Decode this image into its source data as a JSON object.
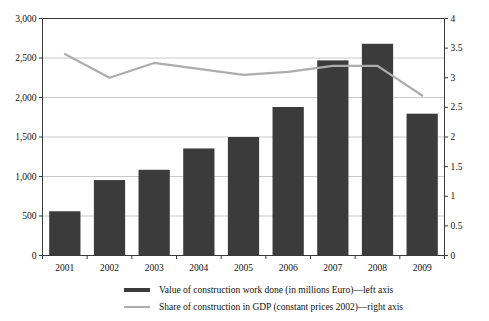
{
  "chart_data": {
    "type": "bar",
    "title": "",
    "subtitle": "",
    "xlabel": "",
    "ylabel": "",
    "grid": true,
    "legend_position": "bottom",
    "categories": [
      "2001",
      "2002",
      "2003",
      "2004",
      "2005",
      "2006",
      "2007",
      "2008",
      "2009"
    ],
    "left_axis": {
      "label": "Value of construction work done (in millions Euro)",
      "min": 0,
      "max": 3000,
      "tick_step": 500,
      "ticks": [
        "0",
        "500",
        "1,000",
        "1,500",
        "2,000",
        "2,500",
        "3,000"
      ],
      "tick_values": [
        0,
        500,
        1000,
        1500,
        2000,
        2500,
        3000
      ]
    },
    "right_axis": {
      "label": "Share of construction in GDP (constant prices 2002)",
      "min": 0,
      "max": 4,
      "tick_step": 0.5,
      "ticks": [
        "0",
        "0.5",
        "1",
        "1.5",
        "2",
        "2.5",
        "3",
        "3.5",
        "4"
      ],
      "tick_values": [
        0,
        0.5,
        1,
        1.5,
        2,
        2.5,
        3,
        3.5,
        4
      ]
    },
    "series": [
      {
        "name": "Value of construction work done (in millions Euro)—left axis",
        "type": "bar",
        "axis": "left",
        "color": "#3b3b3b",
        "values": [
          560,
          955,
          1085,
          1355,
          1500,
          1880,
          2470,
          2680,
          1795
        ]
      },
      {
        "name": "Share of construction in GDP (constant prices 2002)—right axis",
        "type": "line",
        "axis": "right",
        "color": "#adadad",
        "values": [
          3.4,
          3.0,
          3.25,
          3.15,
          3.05,
          3.1,
          3.2,
          3.2,
          2.7
        ]
      }
    ]
  },
  "legend": {
    "items": [
      {
        "marker": "bar",
        "label": "Value of construction work done (in millions Euro)—left axis"
      },
      {
        "marker": "line",
        "label": "Share of construction in GDP (constant prices 2002)—right axis"
      }
    ]
  },
  "colors": {
    "bar": "#3b3b3b",
    "line": "#adadad",
    "grid": "#c9c9c9",
    "axis": "#3a3a3a",
    "text": "#111111",
    "background": "#ffffff"
  }
}
